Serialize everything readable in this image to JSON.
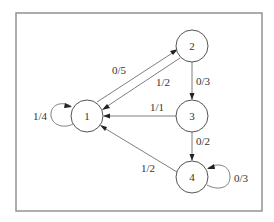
{
  "diagram": {
    "type": "state-transition-graph",
    "nodes": [
      {
        "id": "1",
        "label": "1"
      },
      {
        "id": "2",
        "label": "2"
      },
      {
        "id": "3",
        "label": "3"
      },
      {
        "id": "4",
        "label": "4"
      }
    ],
    "edges": [
      {
        "from": "1",
        "to": "2",
        "label": "0/5"
      },
      {
        "from": "2",
        "to": "1",
        "label": "1/2"
      },
      {
        "from": "2",
        "to": "3",
        "label": "0/3"
      },
      {
        "from": "3",
        "to": "1",
        "label": "1/1"
      },
      {
        "from": "3",
        "to": "4",
        "label": "0/2"
      },
      {
        "from": "4",
        "to": "1",
        "label": "1/2"
      },
      {
        "from": "1",
        "to": "1",
        "label": "1/4"
      },
      {
        "from": "4",
        "to": "4",
        "label": "0/3"
      }
    ],
    "colors": {
      "frame": "#8a8a8a",
      "node_stroke": "#555555",
      "edge": "#707070",
      "arrow": "#222222",
      "text": "#333333"
    }
  }
}
